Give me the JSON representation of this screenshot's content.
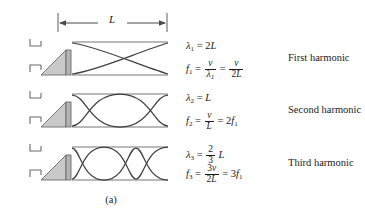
{
  "figure": {
    "caption": "(a)",
    "dimension_label": "L",
    "background_color": "#ffffff",
    "line_color": "#3f3f3f",
    "tube_color": "#777777",
    "cone_fill_color": "#c9c9c9"
  },
  "rows": [
    {
      "name": "first-harmonic",
      "harmonic_label": "First harmonic",
      "wavelength": {
        "symbol": "λ",
        "subscript": "1",
        "equals": "=",
        "value_coefficient": "2",
        "value_variable": "L"
      },
      "frequency": {
        "symbol": "f",
        "subscript": "1",
        "expr1_num": "v",
        "expr1_den_symbol": "λ",
        "expr1_den_sub": "1",
        "expr2_num": "v",
        "expr2_den": "2L"
      },
      "antinodes": 1,
      "wavelengths_in_tube": 0.5
    },
    {
      "name": "second-harmonic",
      "harmonic_label": "Second harmonic",
      "wavelength": {
        "symbol": "λ",
        "subscript": "2",
        "equals": "=",
        "value_coefficient": "",
        "value_variable": "L"
      },
      "frequency": {
        "symbol": "f",
        "subscript": "2",
        "expr1_num": "v",
        "expr1_den": "L",
        "expr2": "2f",
        "expr2_sub": "1"
      },
      "antinodes": 2,
      "wavelengths_in_tube": 1.0
    },
    {
      "name": "third-harmonic",
      "harmonic_label": "Third harmonic",
      "wavelength": {
        "symbol": "λ",
        "subscript": "3",
        "equals": "=",
        "frac_num": "2",
        "frac_den": "3",
        "value_variable": "L"
      },
      "frequency": {
        "symbol": "f",
        "subscript": "3",
        "expr1_num": "3v",
        "expr1_den": "2L",
        "expr2": "3f",
        "expr2_sub": "1"
      },
      "antinodes": 3,
      "wavelengths_in_tube": 1.5
    }
  ]
}
